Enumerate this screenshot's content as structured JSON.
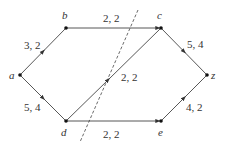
{
  "diagram": {
    "type": "flow-network",
    "nodes": [
      {
        "id": "a",
        "label": "a",
        "x": 20,
        "y": 75
      },
      {
        "id": "b",
        "label": "b",
        "x": 66,
        "y": 28
      },
      {
        "id": "c",
        "label": "c",
        "x": 161,
        "y": 28
      },
      {
        "id": "z",
        "label": "z",
        "x": 207,
        "y": 75
      },
      {
        "id": "d",
        "label": "d",
        "x": 66,
        "y": 121
      },
      {
        "id": "e",
        "label": "e",
        "x": 161,
        "y": 121
      }
    ],
    "edges": [
      {
        "from": "a",
        "to": "b",
        "label": "3, 2"
      },
      {
        "from": "b",
        "to": "c",
        "label": "2, 2"
      },
      {
        "from": "c",
        "to": "z",
        "label": "5, 4"
      },
      {
        "from": "a",
        "to": "d",
        "label": "5, 4"
      },
      {
        "from": "d",
        "to": "c",
        "label": "2, 2"
      },
      {
        "from": "d",
        "to": "e",
        "label": "2, 2"
      },
      {
        "from": "e",
        "to": "z",
        "label": "4, 2"
      }
    ],
    "cut": {
      "style": "dashed",
      "from": [
        138,
        10
      ],
      "to": [
        80,
        142
      ]
    }
  }
}
